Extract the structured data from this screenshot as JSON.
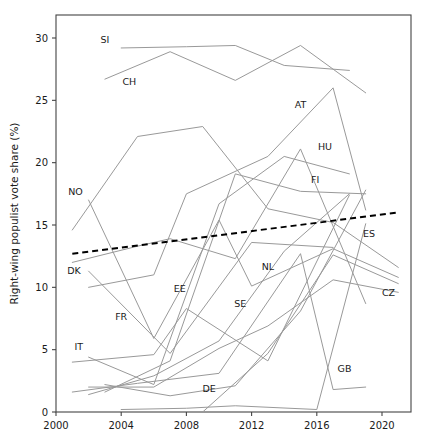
{
  "chart_data": {
    "type": "line",
    "title": "",
    "subtitle": "",
    "xlabel": "",
    "ylabel": "Right-wing populist vote share (%)",
    "xlim": [
      2000,
      2021.6
    ],
    "ylim": [
      0,
      32
    ],
    "xticks": [
      2000,
      2004,
      2008,
      2012,
      2016,
      2020
    ],
    "xticklabels": [
      "2000",
      "2004",
      "2008",
      "2012",
      "2016",
      "2020"
    ],
    "yticks": [
      0,
      5,
      10,
      15,
      20,
      25,
      30
    ],
    "yticklabels": [
      "0",
      "5",
      "10",
      "15",
      "20",
      "25",
      "30"
    ],
    "grid": false,
    "legend": "none",
    "line_color": "#999999",
    "trend_color": "#000000",
    "frame_color": "#444444",
    "series": [
      {
        "name": "SI",
        "label": "SI",
        "label_x": 2003.0,
        "label_y": 29.6,
        "x": [
          2004.0,
          2008.0,
          2011.0,
          2014.0,
          2018.0
        ],
        "y": [
          29.2,
          29.3,
          29.4,
          27.8,
          27.4
        ]
      },
      {
        "name": "CH",
        "label": "CH",
        "label_x": 2004.5,
        "label_y": 26.2,
        "x": [
          2003.0,
          2007.0,
          2011.0,
          2015.0,
          2019.0
        ],
        "y": [
          26.7,
          28.9,
          26.6,
          29.4,
          25.6
        ]
      },
      {
        "name": "AT",
        "label": "AT",
        "label_x": 2015.0,
        "label_y": 24.4,
        "x": [
          2002.0,
          2006.0,
          2008.0,
          2013.0,
          2017.0,
          2019.0
        ],
        "y": [
          10.0,
          11.0,
          17.5,
          20.5,
          26.0,
          16.2
        ]
      },
      {
        "name": "HU",
        "label": "HU",
        "label_x": 2016.5,
        "label_y": 21.0,
        "x": [
          2002.0,
          2006.0,
          2010.0,
          2014.0,
          2018.0
        ],
        "y": [
          4.4,
          2.2,
          16.7,
          20.5,
          19.1
        ]
      },
      {
        "name": "FI",
        "label": "FI",
        "label_x": 2015.9,
        "label_y": 18.4,
        "x": [
          2003.0,
          2007.0,
          2011.0,
          2015.0,
          2019.0
        ],
        "y": [
          1.6,
          4.1,
          19.1,
          17.7,
          17.5
        ]
      },
      {
        "name": "NO",
        "label": "NO",
        "label_x": 2001.2,
        "label_y": 17.4,
        "x": [
          2001.0,
          2005.0,
          2009.0,
          2013.0,
          2017.0,
          2021.0
        ],
        "y": [
          14.6,
          22.1,
          22.9,
          16.3,
          15.2,
          11.6
        ]
      },
      {
        "name": "DK",
        "label": "DK",
        "label_x": 2001.1,
        "label_y": 11.1,
        "x": [
          2001.0,
          2005.0,
          2007.0,
          2011.0,
          2015.0,
          2019.0
        ],
        "y": [
          12.0,
          13.3,
          13.9,
          12.3,
          21.1,
          8.7
        ]
      },
      {
        "name": "EE",
        "label": "EE",
        "label_x": 2007.6,
        "label_y": 9.6,
        "x": [
          2003.0,
          2007.0,
          2011.0,
          2015.0,
          2019.0
        ],
        "y": [
          2.2,
          1.3,
          2.1,
          8.1,
          17.8
        ]
      },
      {
        "name": "NL",
        "label": "NL",
        "label_x": 2013.0,
        "label_y": 11.4,
        "x": [
          2002.0,
          2006.0,
          2010.0,
          2012.0,
          2017.0,
          2021.0
        ],
        "y": [
          17.0,
          5.9,
          15.4,
          10.1,
          13.1,
          10.8
        ]
      },
      {
        "name": "SE",
        "label": "SE",
        "label_x": 2011.3,
        "label_y": 8.4,
        "x": [
          2002.0,
          2006.0,
          2010.0,
          2014.0,
          2018.0
        ],
        "y": [
          1.4,
          2.9,
          5.7,
          12.9,
          17.5
        ]
      },
      {
        "name": "FR",
        "label": "FR",
        "label_x": 2004.0,
        "label_y": 7.4,
        "x": [
          2002.0,
          2007.0,
          2012.0,
          2017.0
        ],
        "y": [
          11.3,
          4.7,
          13.6,
          13.2
        ]
      },
      {
        "name": "IT",
        "label": "IT",
        "label_x": 2001.4,
        "label_y": 5.0,
        "x": [
          2001.0,
          2006.0,
          2008.0,
          2013.0,
          2018.0
        ],
        "y": [
          4.0,
          4.6,
          8.3,
          4.1,
          17.4
        ]
      },
      {
        "name": "DE",
        "label": "DE",
        "label_x": 2009.4,
        "label_y": 1.6,
        "x": [
          2009.0,
          2013.0,
          2017.0,
          2021.0
        ],
        "y": [
          0.0,
          4.7,
          12.6,
          10.3
        ]
      },
      {
        "name": "GB",
        "label": "GB",
        "label_x": 2017.7,
        "label_y": 3.2,
        "x": [
          2001.0,
          2005.0,
          2010.0,
          2015.0,
          2017.0,
          2019.0
        ],
        "y": [
          1.6,
          2.3,
          3.1,
          12.7,
          1.8,
          2.0
        ]
      },
      {
        "name": "ES",
        "label": "ES",
        "label_x": 2019.2,
        "label_y": 14.0,
        "x": [
          2004.0,
          2008.0,
          2011.0,
          2016.0,
          2019.0
        ],
        "y": [
          0.2,
          0.3,
          0.5,
          0.2,
          15.1
        ]
      },
      {
        "name": "CZ",
        "label": "CZ",
        "label_x": 2020.4,
        "label_y": 9.3,
        "x": [
          2002.0,
          2006.0,
          2010.0,
          2013.0,
          2017.0,
          2021.0
        ],
        "y": [
          2.0,
          2.0,
          5.1,
          6.9,
          10.6,
          9.6
        ]
      }
    ],
    "trend": {
      "name": "trend",
      "style": "dashed",
      "x": [
        2001.0,
        2021.0
      ],
      "y": [
        12.7,
        16.0
      ]
    }
  }
}
